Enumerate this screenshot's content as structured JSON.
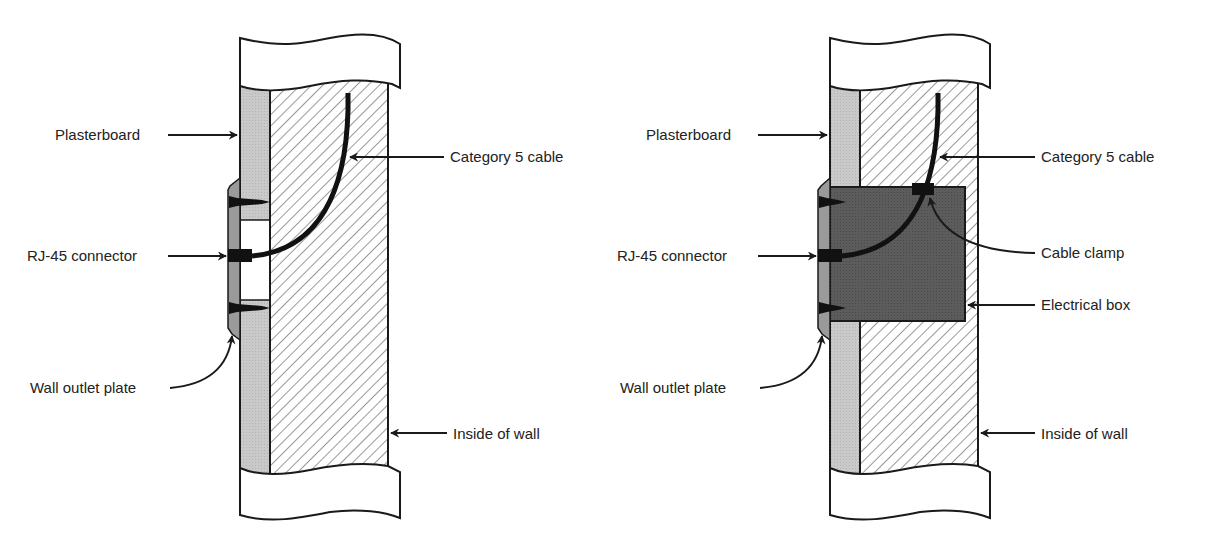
{
  "diagrams": [
    {
      "id": "without-box",
      "labels": {
        "plasterboard": "Plasterboard",
        "cable": "Category 5 cable",
        "connector": "RJ-45 connector",
        "plate": "Wall outlet plate",
        "inside": "Inside of wall"
      }
    },
    {
      "id": "with-box",
      "labels": {
        "plasterboard": "Plasterboard",
        "cable": "Category 5 cable",
        "connector": "RJ-45 connector",
        "clamp": "Cable clamp",
        "box": "Electrical box",
        "plate": "Wall outlet plate",
        "inside": "Inside of wall"
      }
    }
  ],
  "colors": {
    "plasterboard": "#c8c8c8",
    "plate": "#9a9a9a",
    "electrical_box": "#5a5a5a",
    "cable": "#111111",
    "outline": "#1a1a1a",
    "hatch": "#444444"
  }
}
